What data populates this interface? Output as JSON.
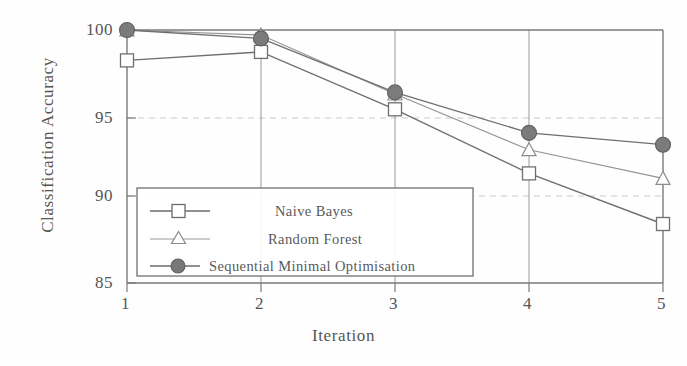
{
  "chart_data": {
    "type": "line",
    "title": "",
    "xlabel": "Iteration",
    "ylabel": "Classification Accuracy",
    "x": [
      1,
      2,
      3,
      4,
      5
    ],
    "xticklabels": [
      "1",
      "2",
      "3",
      "4",
      "5"
    ],
    "yticklabels": [
      "85",
      "90",
      "95",
      "100"
    ],
    "yticks": [
      85,
      90,
      95,
      100
    ],
    "xlim": [
      1,
      5
    ],
    "ylim": [
      85,
      100
    ],
    "grid": "horizontal-dashed",
    "legend_position": "lower-left-inside",
    "series": [
      {
        "name": "Naive Bayes",
        "marker": "open-square",
        "color": "#6b6b6b",
        "values": [
          98.2,
          98.7,
          95.3,
          91.5,
          88.5
        ]
      },
      {
        "name": "Random Forest",
        "marker": "open-triangle",
        "color": "#6b6b6b",
        "values": [
          100.0,
          99.7,
          96.2,
          92.9,
          91.2
        ]
      },
      {
        "name": "Sequential Minimal Optimisation",
        "marker": "filled-circle",
        "color": "#6b6b6b",
        "values": [
          100.0,
          99.5,
          96.3,
          93.9,
          93.2
        ]
      }
    ]
  },
  "axes": {
    "ylabel": "Classification Accuracy",
    "xlabel": "Iteration",
    "yticks": [
      "100",
      "95",
      "90",
      "85"
    ],
    "xticks": [
      "1",
      "2",
      "3",
      "4",
      "5"
    ]
  },
  "legend": {
    "entries": [
      {
        "label": "Naive Bayes",
        "marker": "open-square"
      },
      {
        "label": "Random Forest",
        "marker": "open-triangle"
      },
      {
        "label": "Sequential Minimal Optimisation",
        "marker": "filled-circle"
      }
    ]
  },
  "style": {
    "line_color": "#6b6b6b",
    "grid_color": "#c8c8c8",
    "axis_color": "#6b6b6b",
    "text_color": "#555555",
    "background": "#fefefe"
  }
}
